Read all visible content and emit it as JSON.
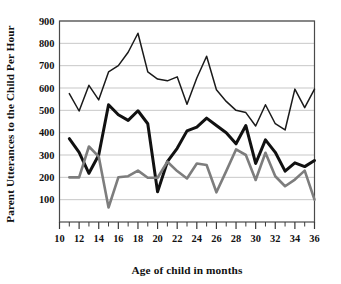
{
  "chart_data": {
    "type": "line",
    "title": "",
    "xlabel": "Age of child in months",
    "ylabel": "Parent Utterances to the Child Per Hour",
    "xlim": [
      10,
      36
    ],
    "ylim": [
      0,
      900
    ],
    "grid": true,
    "legend_position": "none",
    "xticks": [
      10,
      11,
      12,
      13,
      14,
      15,
      16,
      17,
      18,
      19,
      20,
      21,
      22,
      23,
      24,
      25,
      26,
      27,
      28,
      29,
      30,
      31,
      32,
      33,
      34,
      35,
      36
    ],
    "xtick_labels": [
      "10",
      "12",
      "14",
      "16",
      "18",
      "20",
      "22",
      "24",
      "26",
      "28",
      "30",
      "32",
      "34",
      "36"
    ],
    "xtick_label_values": [
      10,
      12,
      14,
      16,
      18,
      20,
      22,
      24,
      26,
      28,
      30,
      32,
      34,
      36
    ],
    "yticks": [
      100,
      200,
      300,
      400,
      500,
      600,
      700,
      800,
      900
    ],
    "ytick_labels": [
      "100",
      "200",
      "300",
      "400",
      "500",
      "600",
      "700",
      "800",
      "900"
    ],
    "x": [
      11,
      12,
      13,
      14,
      15,
      16,
      17,
      18,
      19,
      20,
      21,
      22,
      23,
      24,
      25,
      26,
      27,
      28,
      29,
      30,
      31,
      32,
      33,
      34,
      35,
      36
    ],
    "series": [
      {
        "name": "upper-group",
        "color": "#1a1a1a",
        "stroke_width": 1.5,
        "values": [
          575,
          497,
          612,
          547,
          672,
          700,
          760,
          845,
          672,
          640,
          632,
          650,
          527,
          645,
          742,
          592,
          540,
          500,
          490,
          430,
          525,
          440,
          412,
          595,
          512,
          595
        ]
      },
      {
        "name": "middle-group",
        "color": "#111111",
        "stroke_width": 3.0,
        "values": [
          373,
          312,
          218,
          300,
          525,
          480,
          455,
          498,
          440,
          135,
          270,
          330,
          408,
          425,
          465,
          432,
          400,
          350,
          432,
          262,
          368,
          312,
          228,
          265,
          248,
          275
        ]
      },
      {
        "name": "lower-group",
        "color": "#7d7d7d",
        "stroke_width": 2.6,
        "values": [
          200,
          200,
          338,
          293,
          65,
          200,
          205,
          230,
          198,
          198,
          270,
          228,
          195,
          262,
          255,
          133,
          228,
          325,
          300,
          188,
          310,
          205,
          160,
          190,
          230,
          100
        ]
      }
    ]
  }
}
